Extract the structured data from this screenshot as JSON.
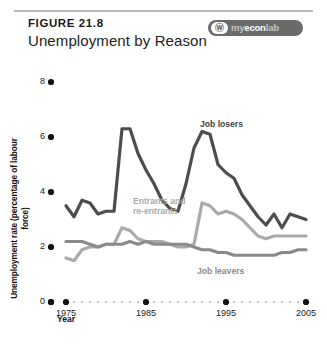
{
  "header": {
    "figure_number": "FIGURE 21.8",
    "title": "Unemployment by Reason",
    "badge": {
      "name": "myeconlab-badge",
      "mark_glyph": "Ⓦ",
      "text_prefix": "my",
      "text_middle": "econ",
      "text_suffix": "lab"
    }
  },
  "chart_data": {
    "type": "line",
    "title": "Unemployment by Reason",
    "xlabel": "Year",
    "ylabel": "Unemployment rate (percentage of labour force)",
    "xlim": [
      1975,
      2005
    ],
    "ylim": [
      0,
      8
    ],
    "yticks": [
      0,
      2,
      4,
      6,
      8
    ],
    "ytick_labels": [
      "0",
      "2",
      "4",
      "6",
      "8"
    ],
    "xticks": [
      1975,
      1985,
      1995,
      2005
    ],
    "xtick_labels": [
      "1975",
      "1985",
      "1995",
      "2005"
    ],
    "grid": false,
    "legend_position": "inline-annotations",
    "x": [
      1975,
      1976,
      1977,
      1978,
      1979,
      1980,
      1981,
      1982,
      1983,
      1984,
      1985,
      1986,
      1987,
      1988,
      1989,
      1990,
      1991,
      1992,
      1993,
      1994,
      1995,
      1996,
      1997,
      1998,
      1999,
      2000,
      2001,
      2002,
      2003,
      2004,
      2005
    ],
    "series": [
      {
        "name": "Job losers",
        "color": "#4d4d4d",
        "values": [
          3.5,
          3.1,
          3.7,
          3.6,
          3.2,
          3.3,
          3.3,
          6.3,
          6.3,
          5.4,
          4.8,
          4.3,
          3.7,
          3.4,
          3.3,
          4.3,
          5.6,
          6.2,
          6.1,
          5.0,
          4.7,
          4.5,
          3.9,
          3.5,
          3.1,
          2.8,
          3.2,
          2.7,
          3.2,
          3.1,
          3.0
        ],
        "label_text": "Job losers"
      },
      {
        "name": "Entrants and re-entrants",
        "color": "#a9a9a9",
        "values": [
          1.6,
          1.5,
          1.9,
          2.0,
          2.0,
          2.1,
          2.1,
          2.7,
          2.6,
          2.3,
          2.2,
          2.2,
          2.2,
          2.1,
          2.0,
          2.0,
          2.1,
          3.6,
          3.5,
          3.2,
          3.3,
          3.2,
          3.0,
          2.7,
          2.4,
          2.3,
          2.4,
          2.4,
          2.4,
          2.4,
          2.4
        ],
        "label_text": "Entrants and re-entrants"
      },
      {
        "name": "Job leavers",
        "color": "#8a8a8a",
        "values": [
          2.2,
          2.2,
          2.2,
          2.1,
          2.0,
          2.1,
          2.1,
          2.1,
          2.2,
          2.1,
          2.2,
          2.1,
          2.1,
          2.1,
          2.1,
          2.1,
          2.0,
          1.9,
          1.9,
          1.8,
          1.8,
          1.7,
          1.7,
          1.7,
          1.7,
          1.7,
          1.7,
          1.8,
          1.8,
          1.9,
          1.9
        ],
        "label_text": "Job leavers"
      }
    ]
  },
  "annotations": {
    "job_losers": "Job losers",
    "entrants_line1": "Entrants and",
    "entrants_line2": "re-entrants",
    "job_leavers": "Job leavers"
  },
  "colors": {
    "job_losers": "#4d4d4d",
    "entrants": "#a9a9a9",
    "job_leavers": "#8a8a8a",
    "axis": "#111111",
    "rule": "#b9b9b9",
    "badge_bg": "#6b6b6b"
  }
}
